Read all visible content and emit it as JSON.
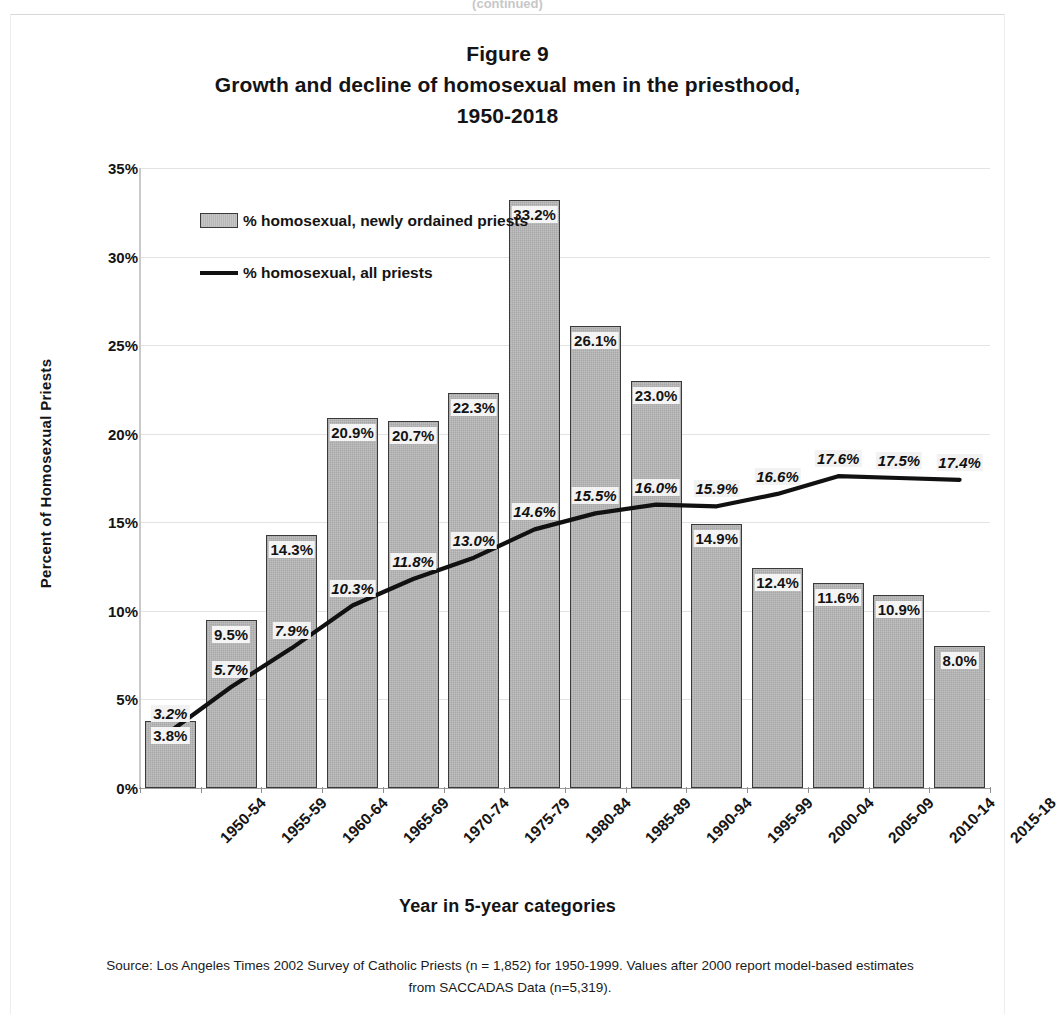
{
  "page": {
    "cutoff_text": "(continued)"
  },
  "title": {
    "line1": "Figure 9",
    "line2": "Growth and decline of homosexual men in the priesthood,",
    "line3": "1950-2018"
  },
  "axes": {
    "y_title": "Percent of Homosexual Priests",
    "x_title": "Year in 5-year categories"
  },
  "legend": {
    "bar_series": "% homosexual, newly ordained priests",
    "line_series": "% homosexual, all priests"
  },
  "source": {
    "line1": "Source: Los Angeles Times 2002 Survey of Catholic Priests (n = 1,852) for 1950-1999.   Values after",
    "line2": "2000  report model-based estimates from SACCADAS Data (n=5,319)."
  },
  "colors": {
    "bar_fill": "#b9b9b9",
    "bar_border": "#3a3a3a",
    "line": "#111111",
    "grid": "#e3e3e3",
    "text": "#141414"
  },
  "chart_data": {
    "type": "bar",
    "xlabel": "Year in 5-year categories",
    "ylabel": "Percent of Homosexual Priests",
    "ylim": [
      0,
      35
    ],
    "ytick_values": [
      0,
      5,
      10,
      15,
      20,
      25,
      30,
      35
    ],
    "ytick_labels": [
      "0%",
      "5%",
      "10%",
      "15%",
      "20%",
      "25%",
      "30%",
      "35%"
    ],
    "grid": true,
    "legend_position": "upper-left-inside",
    "categories": [
      "1950-54",
      "1955-59",
      "1960-64",
      "1965-69",
      "1970-74",
      "1975-79",
      "1980-84",
      "1985-89",
      "1990-94",
      "1995-99",
      "2000-04",
      "2005-09",
      "2010-14",
      "2015-18"
    ],
    "series": [
      {
        "name": "% homosexual, newly ordained priests",
        "type": "bar",
        "values": [
          3.8,
          9.5,
          14.3,
          20.9,
          20.7,
          22.3,
          33.2,
          26.1,
          23.0,
          14.9,
          12.4,
          11.6,
          10.9,
          8.0
        ],
        "labels": [
          "3.8%",
          "9.5%",
          "14.3%",
          "20.9%",
          "20.7%",
          "22.3%",
          "33.2%",
          "26.1%",
          "23.0%",
          "14.9%",
          "12.4%",
          "11.6%",
          "10.9%",
          "8.0%"
        ]
      },
      {
        "name": "% homosexual, all priests",
        "type": "line",
        "values": [
          3.2,
          5.7,
          7.9,
          10.3,
          11.8,
          13.0,
          14.6,
          15.5,
          16.0,
          15.9,
          16.6,
          17.6,
          17.5,
          17.4
        ],
        "labels": [
          "3.2%",
          "5.7%",
          "7.9%",
          "10.3%",
          "11.8%",
          "13.0%",
          "14.6%",
          "15.5%",
          "16.0%",
          "15.9%",
          "16.6%",
          "17.6%",
          "17.5%",
          "17.4%"
        ]
      }
    ]
  }
}
